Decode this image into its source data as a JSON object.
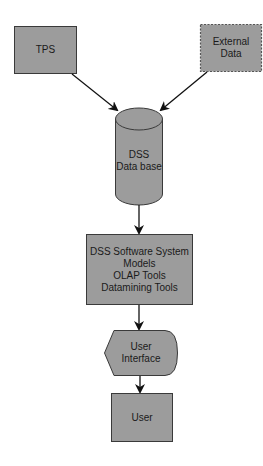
{
  "diagram": {
    "colors": {
      "fill": "#9c9c9c",
      "stroke": "#3a3a3a",
      "arrow": "#111111",
      "text": "#1a1a1a"
    },
    "nodes": {
      "tps": {
        "label": "TPS",
        "shape": "rectangle"
      },
      "external_data": {
        "label": "External\nData",
        "shape": "dashed-rectangle"
      },
      "dss_database": {
        "label": "DSS\nData base",
        "shape": "cylinder"
      },
      "dss_software": {
        "label": "DSS Software System\nModels\nOLAP Tools\nDatamining Tools",
        "shape": "rectangle"
      },
      "user_interface": {
        "label": "User\nInterface",
        "shape": "display"
      },
      "user": {
        "label": "User",
        "shape": "rectangle"
      }
    },
    "edges": [
      {
        "from": "tps",
        "to": "dss_database"
      },
      {
        "from": "external_data",
        "to": "dss_database"
      },
      {
        "from": "dss_database",
        "to": "dss_software"
      },
      {
        "from": "dss_software",
        "to": "user_interface"
      },
      {
        "from": "user_interface",
        "to": "user"
      }
    ]
  }
}
